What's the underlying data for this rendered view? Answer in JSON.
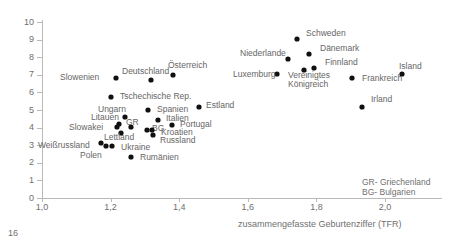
{
  "chart_data": {
    "type": "scatter",
    "title": "",
    "xlabel": "zusammengefasste Geburtenziffer (TFR)",
    "ylabel": "",
    "xlim": [
      1.0,
      2.12
    ],
    "ylim": [
      0,
      10
    ],
    "xticks": [
      "1,0",
      "1,2",
      "1,4",
      "1,6",
      "1,8",
      "2,0"
    ],
    "xtick_values": [
      1.0,
      1.2,
      1.4,
      1.6,
      1.8,
      2.0
    ],
    "yticks": [
      "0",
      "1",
      "2",
      "3",
      "4",
      "5",
      "6",
      "7",
      "8",
      "9",
      "10"
    ],
    "ytick_values": [
      0,
      1,
      2,
      3,
      4,
      5,
      6,
      7,
      8,
      9,
      10
    ],
    "grid": false,
    "legend": "none",
    "marker_color": "#111111",
    "axis_color": "#b9b9b9",
    "text_color": "#6f6f6f",
    "points": [
      {
        "label": "Slowenien",
        "x": 1.216,
        "y": 6.82,
        "lx": 60,
        "ly": 73,
        "multiline": false
      },
      {
        "label": "Deutschland",
        "x": 1.318,
        "y": 6.7,
        "lx": 122,
        "ly": 67,
        "multiline": false
      },
      {
        "label": "Österreich",
        "x": 1.382,
        "y": 6.99,
        "lx": 168,
        "ly": 61,
        "multiline": false
      },
      {
        "label": "Tschechische Rep.",
        "x": 1.201,
        "y": 5.74,
        "lx": 120,
        "ly": 92,
        "multiline": false
      },
      {
        "label": "Ungarn",
        "x": 1.224,
        "y": 4.2,
        "lx": 98,
        "ly": 105,
        "multiline": false
      },
      {
        "label": "Spanien",
        "x": 1.309,
        "y": 5.0,
        "lx": 157,
        "ly": 105,
        "multiline": false
      },
      {
        "label": "Estland",
        "x": 1.458,
        "y": 5.17,
        "lx": 206,
        "ly": 101,
        "multiline": false
      },
      {
        "label": "Litauen",
        "x": 1.241,
        "y": 4.6,
        "lx": 91,
        "ly": 113,
        "multiline": false
      },
      {
        "label": "Italien",
        "x": 1.338,
        "y": 4.43,
        "lx": 166,
        "ly": 114,
        "multiline": false
      },
      {
        "label": "Slowakei",
        "x": 1.219,
        "y": 4.03,
        "lx": 69,
        "ly": 123,
        "multiline": false
      },
      {
        "label": "GR",
        "x": 1.26,
        "y": 4.03,
        "lx": 126,
        "ly": 118,
        "multiline": false
      },
      {
        "label": "BG",
        "x": 1.307,
        "y": 3.86,
        "lx": 152,
        "ly": 124,
        "multiline": false
      },
      {
        "label": "Kroatien",
        "x": 1.321,
        "y": 3.86,
        "lx": 161,
        "ly": 128,
        "multiline": false
      },
      {
        "label": "Portugal",
        "x": 1.379,
        "y": 4.15,
        "lx": 180,
        "ly": 120,
        "multiline": false
      },
      {
        "label": "Lettland",
        "x": 1.23,
        "y": 3.69,
        "lx": 104,
        "ly": 133,
        "multiline": false
      },
      {
        "label": "Russland",
        "x": 1.324,
        "y": 3.58,
        "lx": 160,
        "ly": 136,
        "multiline": false
      },
      {
        "label": "Weißrussland",
        "x": 1.172,
        "y": 3.12,
        "lx": 38,
        "ly": 141,
        "multiline": false
      },
      {
        "label": "Polen",
        "x": 1.186,
        "y": 2.95,
        "lx": 80,
        "ly": 151,
        "multiline": false
      },
      {
        "label": "Ukraine",
        "x": 1.204,
        "y": 2.95,
        "lx": 121,
        "ly": 143,
        "multiline": false
      },
      {
        "label": "Rumänien",
        "x": 1.26,
        "y": 2.33,
        "lx": 140,
        "ly": 153,
        "multiline": false
      },
      {
        "label": "Schweden",
        "x": 1.744,
        "y": 9.03,
        "lx": 306,
        "ly": 29,
        "multiline": false
      },
      {
        "label": "Dänemark",
        "x": 1.779,
        "y": 8.18,
        "lx": 320,
        "ly": 44,
        "multiline": false
      },
      {
        "label": "Niederlande",
        "x": 1.717,
        "y": 7.9,
        "lx": 240,
        "ly": 49,
        "multiline": false
      },
      {
        "label": "Finnland",
        "x": 1.793,
        "y": 7.39,
        "lx": 325,
        "ly": 58,
        "multiline": false
      },
      {
        "label": "Luxemburg",
        "x": 1.685,
        "y": 7.05,
        "lx": 233,
        "ly": 70,
        "multiline": false
      },
      {
        "label": "Vereinigtes Königreich",
        "x": 1.764,
        "y": 7.28,
        "lx": 288,
        "ly": 71,
        "multiline": true
      },
      {
        "label": "Frankreich",
        "x": 1.904,
        "y": 6.82,
        "lx": 362,
        "ly": 74,
        "multiline": false
      },
      {
        "label": "Island",
        "x": 2.05,
        "y": 7.05,
        "lx": 399,
        "ly": 62,
        "multiline": false
      },
      {
        "label": "Irland",
        "x": 1.933,
        "y": 5.17,
        "lx": 371,
        "ly": 95,
        "multiline": false
      }
    ],
    "abbreviations": [
      "GR- Griechenland",
      "BG- Bulgarien"
    ]
  },
  "footer": {
    "page_number": "16"
  }
}
